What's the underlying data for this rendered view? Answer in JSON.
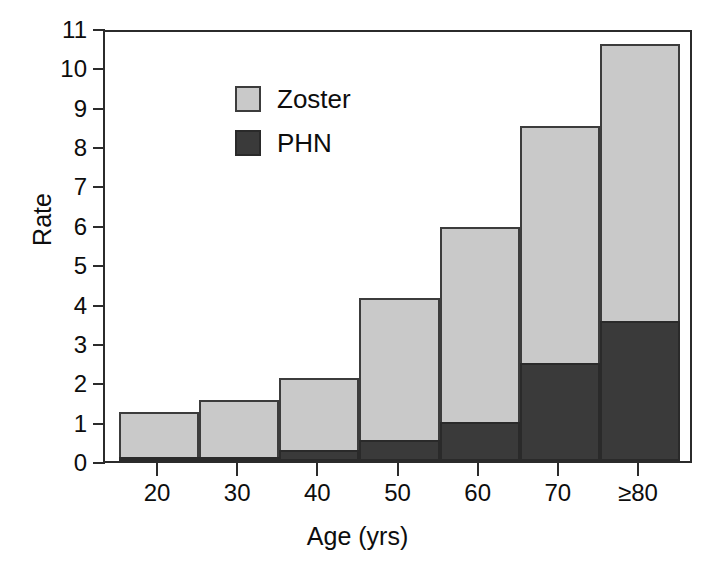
{
  "chart_data": {
    "type": "bar",
    "subtype": "stacked",
    "title": "",
    "xlabel": "Age (yrs)",
    "ylabel": "Rate",
    "categories": [
      "20",
      "30",
      "40",
      "50",
      "60",
      "70",
      "≥80"
    ],
    "series": [
      {
        "name": "Zoster",
        "color": "#c9c9c9",
        "values": [
          1.25,
          1.55,
          2.1,
          4.15,
          5.95,
          8.5,
          10.6
        ]
      },
      {
        "name": "PHN",
        "color": "#3a3a3a",
        "values": [
          0.07,
          0.1,
          0.28,
          0.53,
          1.0,
          2.5,
          3.55
        ]
      }
    ],
    "stack_note": "Zoster values are cumulative bar tops; PHN is the dark sub-segment measured from baseline",
    "ylim": [
      0,
      11
    ],
    "ytick_labels": [
      "0",
      "1",
      "2",
      "3",
      "4",
      "5",
      "6",
      "7",
      "8",
      "9",
      "10",
      "11"
    ],
    "ytick_values": [
      0,
      1,
      2,
      3,
      4,
      5,
      6,
      7,
      8,
      9,
      10,
      11
    ],
    "xtick_labels": [
      "20",
      "30",
      "40",
      "50",
      "60",
      "70",
      "≥80"
    ],
    "grid": false,
    "legend_position": "top-left",
    "legend": [
      "Zoster",
      "PHN"
    ]
  },
  "axes": {
    "y_title": "Rate",
    "x_title": "Age (yrs)"
  },
  "legend": {
    "entries": [
      {
        "label": "Zoster",
        "swatch": "light-gray-square"
      },
      {
        "label": "PHN",
        "swatch": "dark-gray-square"
      }
    ]
  },
  "colors": {
    "zoster": "#c9c9c9",
    "phn": "#3a3a3a",
    "axis": "#2b2b2b",
    "text": "#0d0d0d",
    "background": "#ffffff"
  }
}
